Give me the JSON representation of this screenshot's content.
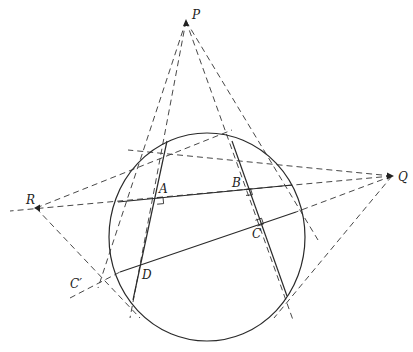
{
  "diagram": {
    "title": "",
    "points": {
      "P": {
        "label": "P",
        "x": 186,
        "y": 21
      },
      "Q": {
        "label": "Q",
        "x": 392,
        "y": 176
      },
      "R": {
        "label": "R",
        "x": 36,
        "y": 208
      },
      "A": {
        "label": "A",
        "x": 156,
        "y": 198
      },
      "B": {
        "label": "B",
        "x": 247,
        "y": 190
      },
      "C": {
        "label": "C",
        "x": 258,
        "y": 225
      },
      "D": {
        "label": "D",
        "x": 139,
        "y": 266
      },
      "C_prime": {
        "label": "C′",
        "x": 70,
        "y": 290
      }
    },
    "circle": {
      "cx": 207,
      "cy": 237,
      "rx": 98,
      "ry": 104
    },
    "solid_lines": [
      {
        "name": "line-through-A",
        "x1": 167,
        "y1": 141,
        "x2": 133,
        "y2": 300
      },
      {
        "name": "line-through-B",
        "x1": 232,
        "y1": 141,
        "x2": 287,
        "y2": 296
      },
      {
        "name": "line-AB",
        "x1": 118,
        "y1": 202,
        "x2": 292,
        "y2": 185
      },
      {
        "name": "line-DC",
        "x1": 120,
        "y1": 272,
        "x2": 296,
        "y2": 212
      }
    ],
    "dashed_lines": [
      {
        "x1": 186,
        "y1": 21,
        "x2": 130,
        "y2": 318
      },
      {
        "x1": 186,
        "y1": 21,
        "x2": 98,
        "y2": 288
      },
      {
        "x1": 186,
        "y1": 21,
        "x2": 293,
        "y2": 320
      },
      {
        "x1": 186,
        "y1": 21,
        "x2": 318,
        "y2": 240
      },
      {
        "x1": 392,
        "y1": 176,
        "x2": 10,
        "y2": 211
      },
      {
        "x1": 392,
        "y1": 176,
        "x2": 128,
        "y2": 150
      },
      {
        "x1": 392,
        "y1": 176,
        "x2": 274,
        "y2": 318
      },
      {
        "x1": 392,
        "y1": 176,
        "x2": 296,
        "y2": 212
      },
      {
        "x1": 36,
        "y1": 208,
        "x2": 232,
        "y2": 130
      },
      {
        "x1": 36,
        "y1": 208,
        "x2": 140,
        "y2": 318
      },
      {
        "x1": 70,
        "y1": 298,
        "x2": 120,
        "y2": 272
      }
    ],
    "right_angle_marks": [
      {
        "at": "A",
        "x": 156,
        "y": 198
      },
      {
        "at": "B",
        "x": 248,
        "y": 189
      },
      {
        "at": "C",
        "x": 260,
        "y": 224
      }
    ]
  }
}
